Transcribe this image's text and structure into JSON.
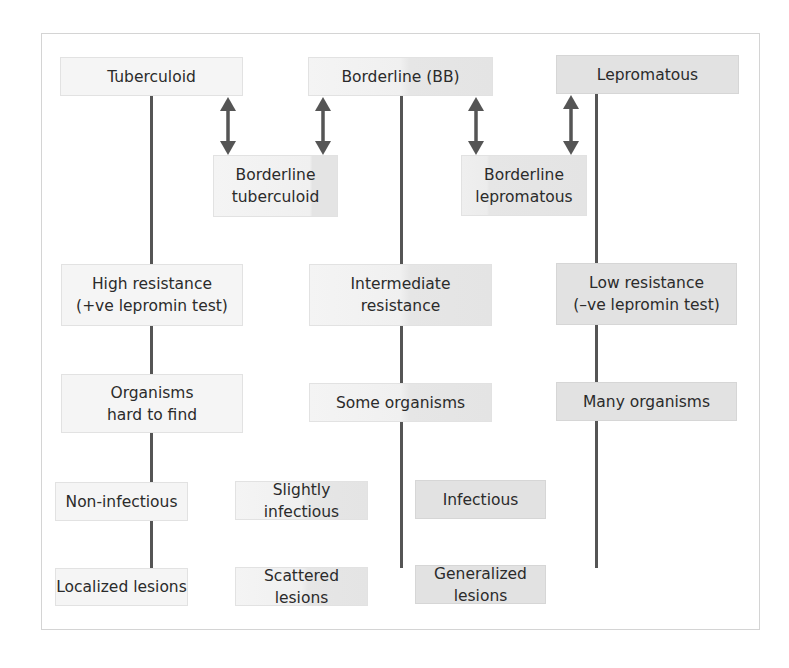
{
  "diagram": {
    "type": "leprosy-spectrum",
    "columns": [
      {
        "id": "tuberculoid",
        "header": "Tuberculoid",
        "resistance": "High resistance\n(+ve lepromin test)",
        "resistance_lines": [
          "High resistance",
          "(+ve lepromin test)"
        ],
        "organisms_lines": [
          "Organisms",
          "hard to find"
        ],
        "infectivity": "Non-infectious",
        "lesions": "Localized lesions"
      },
      {
        "id": "borderline",
        "header": "Borderline (BB)",
        "resistance_lines": [
          "Intermediate",
          "resistance"
        ],
        "organisms_lines": [
          "Some organisms"
        ],
        "infectivity": "Slightly infectious",
        "lesions": "Scattered lesions"
      },
      {
        "id": "lepromatous",
        "header": "Lepromatous",
        "resistance_lines": [
          "Low resistance",
          "(–ve lepromin test)"
        ],
        "organisms_lines": [
          "Many organisms"
        ],
        "infectivity": "Infectious",
        "lesions": "Generalized lesions"
      }
    ],
    "intermediates": [
      {
        "id": "borderline-tuberculoid",
        "lines": [
          "Borderline",
          "tuberculoid"
        ],
        "between": [
          "tuberculoid",
          "borderline"
        ]
      },
      {
        "id": "borderline-lepromatous",
        "lines": [
          "Borderline",
          "lepromatous"
        ],
        "between": [
          "borderline",
          "lepromatous"
        ]
      }
    ],
    "connectors": {
      "vertical_line_color": "#555555",
      "arrow_color": "#555555",
      "arrow_type": "double-headed"
    },
    "colors": {
      "tuberculoid_box": "#f5f5f5",
      "borderline_box": "#ececec",
      "lepromatous_box": "#e2e2e2",
      "frame_border": "#d4d4d4"
    }
  }
}
